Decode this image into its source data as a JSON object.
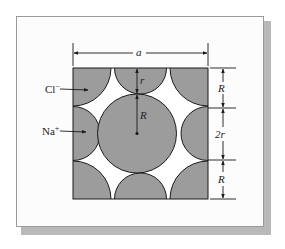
{
  "figure": {
    "labels": {
      "width": "a",
      "anion": "Cl−",
      "anion_base": "Cl",
      "anion_charge": "−",
      "cation": "Na+",
      "cation_base": "Na",
      "cation_charge": "+",
      "small_radius": "r",
      "large_radius": "R",
      "right_top": "R",
      "right_middle": "2r",
      "right_bottom": "R"
    },
    "colors": {
      "ion_fill": "#9c9c9c",
      "void_fill": "#ffffff",
      "outline": "#1a1a1a",
      "frame_border": "#9a9a9a",
      "frame_shadow": "#b9b9b9"
    }
  }
}
